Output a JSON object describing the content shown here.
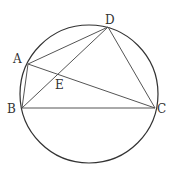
{
  "diagram": {
    "type": "geometry",
    "circle": {
      "cx": 89,
      "cy": 94,
      "r": 69,
      "stroke": "#333333"
    },
    "points": {
      "A": {
        "x": 28,
        "y": 64,
        "label": "A",
        "lx": 13,
        "ly": 63
      },
      "B": {
        "x": 22,
        "y": 108,
        "label": "B",
        "lx": 7,
        "ly": 113
      },
      "C": {
        "x": 155,
        "y": 108,
        "label": "C",
        "lx": 157,
        "ly": 113
      },
      "D": {
        "x": 108,
        "y": 27,
        "label": "D",
        "lx": 105,
        "ly": 24
      },
      "E": {
        "x": 59,
        "y": 77,
        "label": "E",
        "lx": 55,
        "ly": 89
      }
    },
    "segments": [
      [
        "A",
        "B"
      ],
      [
        "B",
        "C"
      ],
      [
        "C",
        "D"
      ],
      [
        "D",
        "A"
      ],
      [
        "A",
        "C"
      ],
      [
        "B",
        "D"
      ]
    ],
    "line_color": "#555555"
  }
}
